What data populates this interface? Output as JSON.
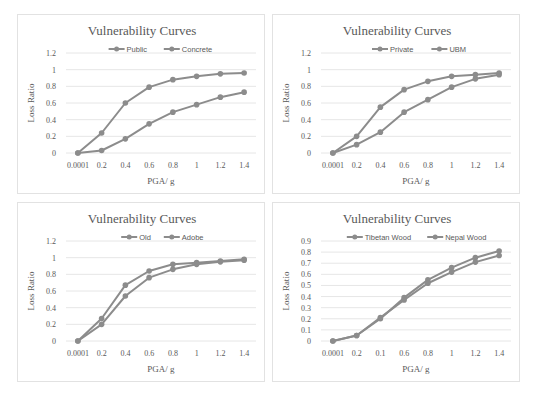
{
  "chart_data": [
    {
      "type": "line",
      "title": "Vulnerability Curves",
      "xlabel": "PGA/ g",
      "ylabel": "Loss Ratio",
      "categories": [
        "0.0001",
        "0.2",
        "0.4",
        "0.6",
        "0.8",
        "1",
        "1.2",
        "1.4"
      ],
      "yticks": [
        "0",
        "0.2",
        "0.4",
        "0.6",
        "0.8",
        "1",
        "1.2"
      ],
      "ylim": [
        0,
        1.2
      ],
      "grid": true,
      "legend_position": "top",
      "series": [
        {
          "name": "Public",
          "values": [
            0,
            0.24,
            0.6,
            0.79,
            0.88,
            0.92,
            0.95,
            0.96
          ]
        },
        {
          "name": "Concrete",
          "values": [
            0,
            0.03,
            0.17,
            0.35,
            0.49,
            0.58,
            0.67,
            0.73
          ]
        }
      ]
    },
    {
      "type": "line",
      "title": "Vulnerability Curves",
      "xlabel": "PGA/ g",
      "ylabel": "Loss Ratio",
      "categories": [
        "0.0001",
        "0.2",
        "0.4",
        "0.6",
        "0.8",
        "1",
        "1.2",
        "1.4"
      ],
      "yticks": [
        "0",
        "0.2",
        "0.4",
        "0.6",
        "0.8",
        "1",
        "1.2"
      ],
      "ylim": [
        0,
        1.2
      ],
      "grid": true,
      "legend_position": "top",
      "series": [
        {
          "name": "Private",
          "values": [
            0,
            0.2,
            0.55,
            0.76,
            0.86,
            0.92,
            0.94,
            0.96
          ]
        },
        {
          "name": "UBM",
          "values": [
            0,
            0.1,
            0.25,
            0.49,
            0.64,
            0.79,
            0.89,
            0.94
          ]
        }
      ]
    },
    {
      "type": "line",
      "title": "Vulnerability Curves",
      "xlabel": "PGA/ g",
      "ylabel": "Loss Ratio",
      "categories": [
        "0.0001",
        "0.2",
        "0.4",
        "0.6",
        "0.8",
        "1",
        "1.2",
        "1.4"
      ],
      "yticks": [
        "0",
        "0.2",
        "0.4",
        "0.6",
        "0.8",
        "1",
        "1.2"
      ],
      "ylim": [
        0,
        1.2
      ],
      "grid": true,
      "legend_position": "top",
      "series": [
        {
          "name": "Old",
          "values": [
            0,
            0.27,
            0.67,
            0.84,
            0.92,
            0.94,
            0.96,
            0.98
          ]
        },
        {
          "name": "Adobe",
          "values": [
            0,
            0.2,
            0.54,
            0.76,
            0.86,
            0.92,
            0.95,
            0.97
          ]
        }
      ]
    },
    {
      "type": "line",
      "title": "Vulnerability Curves",
      "xlabel": "PGA/ g",
      "ylabel": "Loss Ratio",
      "categories": [
        "0.0001",
        "0.2",
        "0.1",
        "0.6",
        "0.8",
        "1",
        "1.2",
        "1.4"
      ],
      "yticks": [
        "0",
        "0.1",
        "0.2",
        "0.3",
        "0.4",
        "0.5",
        "0.6",
        "0.7",
        "0.8",
        "0.9"
      ],
      "ylim": [
        0,
        0.9
      ],
      "grid": true,
      "legend_position": "top",
      "series": [
        {
          "name": "Tibetan Wood",
          "values": [
            0,
            0.05,
            0.2,
            0.39,
            0.55,
            0.66,
            0.75,
            0.81
          ]
        },
        {
          "name": "Nepal Wood",
          "values": [
            0,
            0.05,
            0.21,
            0.37,
            0.52,
            0.62,
            0.71,
            0.77
          ]
        }
      ]
    }
  ],
  "style": {
    "series_color": "#8c8c8c",
    "text_color": "#595959",
    "grid_color": "#e6e6e6",
    "border_color": "#e2e2e2"
  }
}
